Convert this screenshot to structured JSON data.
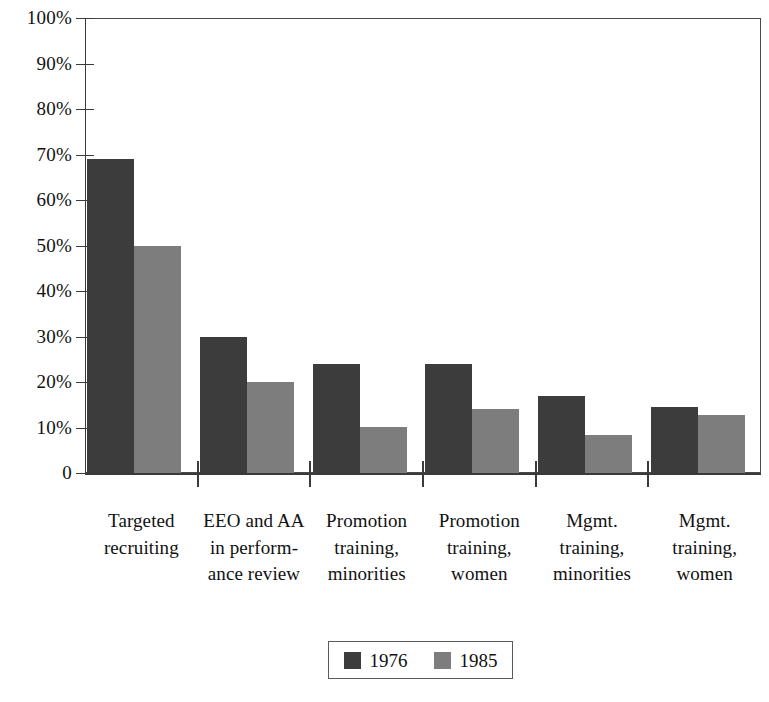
{
  "chart_data": {
    "type": "bar",
    "title": "",
    "subtitle": "",
    "xlabel": "",
    "ylabel": "",
    "ylim": [
      0,
      100
    ],
    "y_unit": "%",
    "grid": false,
    "legend_position": "bottom-center",
    "categories": [
      "Targeted recruiting",
      "EEO and AA in perform-ance review",
      "Promotion training, minorities",
      "Promotion training, women",
      "Mgmt. training, minorities",
      "Mgmt. training, women"
    ],
    "category_lines": [
      [
        "Targeted",
        "recruiting"
      ],
      [
        "EEO and AA",
        "in perform-",
        "ance review"
      ],
      [
        "Promotion",
        "training,",
        "minorities"
      ],
      [
        "Promotion",
        "training,",
        "women"
      ],
      [
        "Mgmt.",
        "training,",
        "minorities"
      ],
      [
        "Mgmt.",
        "training,",
        "women"
      ]
    ],
    "series": [
      {
        "name": "1976",
        "color": "#3c3c3c",
        "values": [
          69,
          30,
          24,
          24,
          17,
          14.5
        ]
      },
      {
        "name": "1985",
        "color": "#7d7d7d",
        "values": [
          50,
          20,
          10.2,
          14,
          8.4,
          12.8
        ]
      }
    ],
    "y_ticks": [
      {
        "value": 100,
        "label": "100%"
      },
      {
        "value": 90,
        "label": "90%"
      },
      {
        "value": 80,
        "label": "80%"
      },
      {
        "value": 70,
        "label": "70%"
      },
      {
        "value": 60,
        "label": "60%"
      },
      {
        "value": 50,
        "label": "50%"
      },
      {
        "value": 40,
        "label": "40%"
      },
      {
        "value": 30,
        "label": "30%"
      },
      {
        "value": 20,
        "label": "20%"
      },
      {
        "value": 10,
        "label": "10%"
      },
      {
        "value": 0,
        "label": "0"
      }
    ],
    "legend": [
      {
        "label": "1976",
        "color": "#3c3c3c"
      },
      {
        "label": "1985",
        "color": "#7d7d7d"
      }
    ]
  }
}
